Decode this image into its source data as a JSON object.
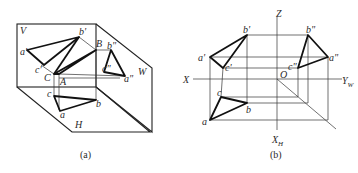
{
  "figure_a": {
    "caption": "(a)",
    "planes": {
      "V": "V",
      "H": "H",
      "W": "W"
    },
    "points_3d": {
      "A": "A",
      "B": "B",
      "C": "C"
    },
    "projections_v": {
      "a": "a'",
      "b": "b'",
      "c": "c'"
    },
    "projections_h": {
      "a": "a",
      "b": "b",
      "c": "c"
    },
    "projections_w": {
      "a": "a\"",
      "b": "b\"",
      "c": "c\""
    }
  },
  "figure_b": {
    "caption": "(b)",
    "axes": {
      "Z": "Z",
      "X": "X",
      "O": "O",
      "YW": "Y",
      "YW_sub": "W",
      "YH": "X",
      "YH_sub": "H"
    },
    "projections_v": {
      "a": "a'",
      "b": "b'",
      "c": "c'"
    },
    "projections_h": {
      "a": "a",
      "b": "b",
      "c": "c"
    },
    "projections_w": {
      "a": "a\"",
      "b": "b\"",
      "c": "c\""
    }
  }
}
